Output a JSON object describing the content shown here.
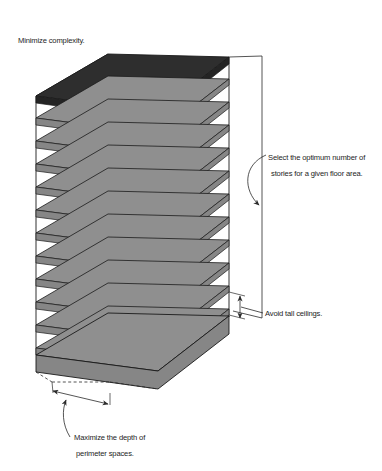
{
  "figure": {
    "background_color": "#ffffff"
  },
  "colors": {
    "roof_fill": "#2e2e2e",
    "floor_fill": "#8f8f8f",
    "floor_fill_shadow": "#868686",
    "outline": "#1a1a1a",
    "text": "#1d1d1d",
    "leader": "#2a2a2a"
  },
  "building": {
    "story_count": 12,
    "roof_label": "roof-plate",
    "floor_label": "floor-plate"
  },
  "annotations": {
    "minimize_complexity": {
      "lines": [
        "Minimize complexity."
      ],
      "line1": "Minimize complexity."
    },
    "optimum_stories": {
      "line1": "Select the optimum number of",
      "line2": "stories for a given floor area."
    },
    "avoid_tall_ceilings": {
      "line1": "Avoid tall ceilings."
    },
    "maximize_depth": {
      "line1": "Maximize the depth of",
      "line2": "perimeter spaces."
    }
  }
}
